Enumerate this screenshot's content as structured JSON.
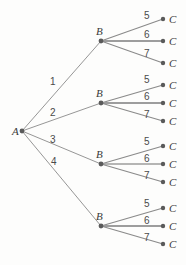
{
  "diagram": {
    "type": "tree",
    "title": "",
    "canvas": {
      "width": 186,
      "height": 265,
      "background": "#fdfdfc"
    },
    "style": {
      "edge_color": "#8a8a8a",
      "edge_color_thick": "#9a9a9a",
      "node_color": "#5a5a5a",
      "label_color": "#3a3a3a",
      "edge_label_color": "#4a4a4a"
    },
    "root": {
      "id": "A",
      "label": "A",
      "x": 22,
      "y": 131
    },
    "level1": {
      "edge_labels": [
        "1",
        "2",
        "3",
        "4"
      ],
      "nodes": [
        {
          "id": "B1",
          "label": "B",
          "x": 101,
          "y": 41
        },
        {
          "id": "B2",
          "label": "B",
          "x": 101,
          "y": 103
        },
        {
          "id": "B3",
          "label": "B",
          "x": 101,
          "y": 164
        },
        {
          "id": "B4",
          "label": "B",
          "x": 101,
          "y": 226
        }
      ],
      "edge_label_positions": [
        {
          "label": "1",
          "x": 50,
          "y": 77
        },
        {
          "label": "2",
          "x": 50,
          "y": 108
        },
        {
          "label": "3",
          "x": 50,
          "y": 135
        },
        {
          "label": "4",
          "x": 51,
          "y": 157
        }
      ]
    },
    "level2": {
      "edge_labels": [
        "5",
        "6",
        "7"
      ],
      "groups": [
        {
          "parent": "B1",
          "nodes": [
            {
              "id": "C1",
              "label": "C",
              "x": 163,
              "y": 19,
              "edge_label": "5",
              "edge_label_x": 144,
              "edge_label_y": 11
            },
            {
              "id": "C2",
              "label": "C",
              "x": 163,
              "y": 41,
              "edge_label": "6",
              "edge_label_x": 144,
              "edge_label_y": 30
            },
            {
              "id": "C3",
              "label": "C",
              "x": 163,
              "y": 63,
              "edge_label": "7",
              "edge_label_x": 144,
              "edge_label_y": 49
            }
          ]
        },
        {
          "parent": "B2",
          "nodes": [
            {
              "id": "C4",
              "label": "C",
              "x": 163,
              "y": 85,
              "edge_label": "5",
              "edge_label_x": 144,
              "edge_label_y": 75
            },
            {
              "id": "C5",
              "label": "C",
              "x": 163,
              "y": 103,
              "edge_label": "6",
              "edge_label_x": 144,
              "edge_label_y": 92
            },
            {
              "id": "C6",
              "label": "C",
              "x": 163,
              "y": 121,
              "edge_label": "7",
              "edge_label_x": 144,
              "edge_label_y": 110
            }
          ]
        },
        {
          "parent": "B3",
          "nodes": [
            {
              "id": "C7",
              "label": "C",
              "x": 163,
              "y": 146,
              "edge_label": "5",
              "edge_label_x": 144,
              "edge_label_y": 137
            },
            {
              "id": "C8",
              "label": "C",
              "x": 163,
              "y": 164,
              "edge_label": "6",
              "edge_label_x": 144,
              "edge_label_y": 154
            },
            {
              "id": "C9",
              "label": "C",
              "x": 163,
              "y": 182,
              "edge_label": "7",
              "edge_label_x": 144,
              "edge_label_y": 171
            }
          ]
        },
        {
          "parent": "B4",
          "nodes": [
            {
              "id": "C10",
              "label": "C",
              "x": 163,
              "y": 208,
              "edge_label": "5",
              "edge_label_x": 144,
              "edge_label_y": 199
            },
            {
              "id": "C11",
              "label": "C",
              "x": 163,
              "y": 226,
              "edge_label": "6",
              "edge_label_x": 144,
              "edge_label_y": 216
            },
            {
              "id": "C12",
              "label": "C",
              "x": 163,
              "y": 244,
              "edge_label": "7",
              "edge_label_x": 144,
              "edge_label_y": 233
            }
          ]
        }
      ]
    }
  }
}
